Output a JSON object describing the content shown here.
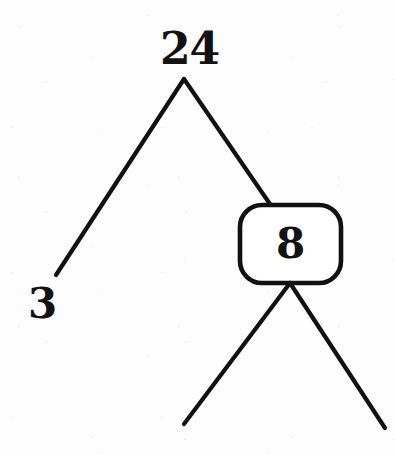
{
  "diagram": {
    "type": "number-bond-tree",
    "canvas": {
      "width": 395,
      "height": 455,
      "background": "#fdfdfd"
    },
    "ink_color": "#111111",
    "nodes": [
      {
        "id": "root",
        "label": "24",
        "shape": "plain-text",
        "x": 184,
        "y": 52,
        "boxed": false
      },
      {
        "id": "left-child",
        "label": "3",
        "shape": "plain-text",
        "x": 40,
        "y": 303,
        "boxed": false
      },
      {
        "id": "right-child",
        "label": "8",
        "shape": "rounded-rect",
        "x": 290,
        "y": 244,
        "boxed": true,
        "box": {
          "left": 240,
          "top": 205,
          "width": 101,
          "height": 78,
          "radius": 22
        }
      },
      {
        "id": "grandchild-left",
        "label": "",
        "shape": "none",
        "x": 184,
        "y": 424,
        "boxed": false
      },
      {
        "id": "grandchild-right",
        "label": "",
        "shape": "none",
        "x": 385,
        "y": 428,
        "boxed": false
      }
    ],
    "edges": [
      {
        "id": "edge-root-left",
        "from": "root",
        "to": "left-child",
        "path": "M 184 79 L 56 275"
      },
      {
        "id": "edge-root-right",
        "from": "root",
        "to": "right-child",
        "path": "M 184 79 L 272 207"
      },
      {
        "id": "edge-right-a",
        "from": "right-child",
        "to": "grandchild-left",
        "path": "M 290 283 L 184 424"
      },
      {
        "id": "edge-right-b",
        "from": "right-child",
        "to": "grandchild-right",
        "path": "M 290 283 L 385 428"
      }
    ]
  }
}
